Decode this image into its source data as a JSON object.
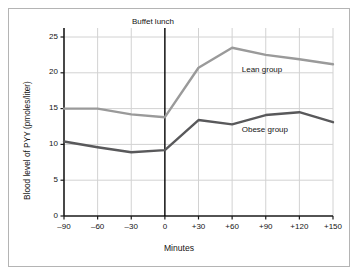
{
  "chart_data": {
    "type": "line",
    "title": "",
    "xlabel": "Minutes",
    "ylabel": "Blood level of PYY (pmoles/liter)",
    "x": [
      -90,
      -60,
      -30,
      0,
      30,
      60,
      90,
      120,
      150
    ],
    "xtick_labels": [
      "–90",
      "–60",
      "–30",
      "0",
      "+30",
      "+60",
      "+90",
      "+120",
      "+150"
    ],
    "ytick_labels": [
      "0",
      "5",
      "10",
      "15",
      "20",
      "25"
    ],
    "yticks": [
      0,
      5,
      10,
      15,
      20,
      25
    ],
    "ylim": [
      0,
      26.5
    ],
    "xlim": [
      -90,
      150
    ],
    "grid": "horizontal-and-vertical",
    "legend_position": "inline-labels",
    "series": [
      {
        "name": "Lean group",
        "color": "#9a9a9a",
        "label_x": 90,
        "label_y": 20.4,
        "values": [
          15.0,
          15.0,
          14.2,
          13.8,
          20.7,
          23.5,
          22.5,
          21.9,
          21.2
        ]
      },
      {
        "name": "Obese group",
        "color": "#59595b",
        "label_x": 90,
        "label_y": 12.0,
        "values": [
          10.4,
          9.6,
          8.9,
          9.2,
          13.4,
          12.8,
          14.1,
          14.5,
          13.1
        ]
      }
    ],
    "annotations": [
      {
        "name": "buffet-lunch",
        "text": "Buffet lunch",
        "x": 0,
        "type": "vertical-line",
        "color": "#000000"
      }
    ]
  },
  "colors": {
    "lean": "#9a9a9a",
    "obese": "#59595b",
    "axis": "#1a1a1a",
    "grid": "#d2d2d2",
    "frame": "#b4b4b4",
    "background": "#ffffff"
  }
}
